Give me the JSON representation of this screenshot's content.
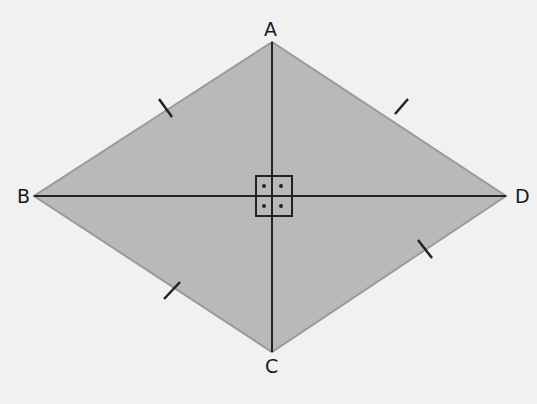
{
  "diagram": {
    "type": "rhombus",
    "fill_color": "#b9b9b9",
    "edge_color": "#9a9a9a",
    "line_color": "#222222",
    "background": "#f1f1f1",
    "vertices": [
      {
        "name": "A",
        "x": 272,
        "y": 42
      },
      {
        "name": "B",
        "x": 34,
        "y": 196
      },
      {
        "name": "C",
        "x": 272,
        "y": 352
      },
      {
        "name": "D",
        "x": 506,
        "y": 196
      }
    ],
    "diagonals": [
      "AC",
      "BD"
    ],
    "right_angle_marker": {
      "at": "intersection",
      "count": 4
    },
    "equal_side_ticks": [
      "AB",
      "AD",
      "BC",
      "CD"
    ],
    "labels": {
      "A": "A",
      "B": "B",
      "C": "C",
      "D": "D"
    }
  }
}
